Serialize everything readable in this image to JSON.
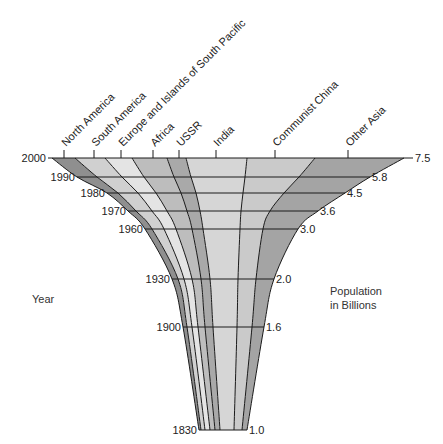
{
  "chart_data": {
    "type": "area",
    "title": "",
    "subtitle": "",
    "xlabel": "Population in Billions",
    "ylabel": "Year",
    "left_axis_label": "Year",
    "right_axis_label_lines": [
      "Population",
      "in Billions"
    ],
    "grid": true,
    "legend_position": "top (rotated region labels)",
    "years": [
      2000,
      1990,
      1980,
      1970,
      1960,
      1930,
      1900,
      1830
    ],
    "total_population_billions": [
      7.5,
      5.8,
      4.5,
      3.6,
      3.0,
      2.0,
      1.6,
      1.0
    ],
    "population_labels": [
      "7.5",
      "5.8",
      "4.5",
      "3.6",
      "3.0",
      "2.0",
      "1.6",
      "1.0"
    ],
    "year_labels": [
      "2000",
      "1990",
      "1980",
      "1970",
      "1960",
      "1930",
      "1900",
      "1830"
    ],
    "regions": [
      {
        "name": "North America",
        "fill": "#8f8f8f"
      },
      {
        "name": "South America",
        "fill": "#d0d0d0"
      },
      {
        "name": "Europe and Islands of South Pacific",
        "fill": "#e4e4e4"
      },
      {
        "name": "Africa",
        "fill": "#bdbdbd"
      },
      {
        "name": "USSR",
        "fill": "#a9a9a9"
      },
      {
        "name": "India",
        "fill": "#d6d6d6"
      },
      {
        "name": "Communist China",
        "fill": "#cacaca"
      },
      {
        "name": "Other Asia",
        "fill": "#a4a4a4"
      }
    ],
    "region_tick_x": [
      64,
      94,
      121,
      153,
      179,
      216,
      275,
      348
    ],
    "row_y": [
      158,
      177,
      193,
      211,
      229,
      279,
      327,
      430
    ],
    "label_x_end": [
      48,
      77,
      107,
      128,
      145,
      172,
      183,
      199
    ],
    "value_x_start": [
      404,
      370,
      345,
      318,
      298,
      274,
      264,
      247
    ],
    "boundaries": [
      [
        52,
        75,
        105,
        132,
        167,
        186,
        247,
        315,
        404
      ],
      [
        77,
        97,
        122,
        144,
        174,
        191,
        245,
        299,
        370
      ],
      [
        107,
        118,
        138,
        156,
        181,
        196,
        243,
        284,
        345
      ],
      [
        128,
        136,
        152,
        167,
        187,
        200,
        241,
        270,
        318
      ],
      [
        145,
        152,
        164,
        176,
        192,
        203,
        240,
        263,
        298
      ],
      [
        172,
        178,
        184,
        192,
        201,
        210,
        238,
        256,
        274
      ],
      [
        183,
        187,
        192,
        198,
        205,
        213,
        237,
        252,
        264
      ],
      [
        199,
        201,
        205,
        210,
        215,
        220,
        234,
        242,
        247
      ]
    ]
  },
  "colors": {
    "line": "#1a1a1a",
    "text": "#222222",
    "background": "#ffffff"
  }
}
